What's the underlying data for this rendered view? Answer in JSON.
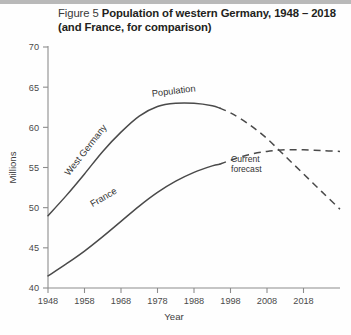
{
  "figure": {
    "number_label": "Figure 5",
    "title_line1": "Population of western Germany, 1948 – 2018",
    "title_line2": "(and France, for comparison)"
  },
  "chart_data": {
    "type": "line",
    "title": "Population of western Germany, 1948 – 2018 (and France, for comparison)",
    "xlabel": "Year",
    "ylabel": "Millions",
    "xlim": [
      1948,
      2028
    ],
    "ylim": [
      40,
      70
    ],
    "xticks": [
      1948,
      1958,
      1968,
      1978,
      1988,
      1998,
      2008,
      2018
    ],
    "yticks": [
      40,
      45,
      50,
      55,
      60,
      65,
      70
    ],
    "grid": false,
    "legend": "inline-labels",
    "series": [
      {
        "name": "West Germany",
        "label": "West Germany",
        "style_solid": "actual",
        "style_dashed": "forecast",
        "forecast_start_year": 1995,
        "x": [
          1948,
          1953,
          1958,
          1963,
          1968,
          1973,
          1978,
          1983,
          1988,
          1993,
          1995,
          1998,
          2003,
          2008,
          2013,
          2018,
          2023,
          2028
        ],
        "y": [
          49.0,
          51.5,
          54.2,
          57.0,
          59.4,
          61.4,
          62.6,
          63.0,
          63.0,
          62.7,
          62.4,
          61.8,
          60.4,
          58.6,
          56.4,
          54.2,
          52.0,
          49.8
        ]
      },
      {
        "name": "France",
        "label": "France",
        "style_solid": "actual",
        "style_dashed": "forecast",
        "forecast_start_year": 1995,
        "x": [
          1948,
          1953,
          1958,
          1963,
          1968,
          1973,
          1978,
          1983,
          1988,
          1993,
          1995,
          1998,
          2003,
          2008,
          2013,
          2018,
          2023,
          2028
        ],
        "y": [
          41.5,
          43.0,
          44.6,
          46.4,
          48.3,
          50.2,
          51.9,
          53.3,
          54.4,
          55.2,
          55.4,
          55.9,
          56.6,
          57.0,
          57.2,
          57.2,
          57.1,
          57.0
        ]
      }
    ],
    "annotations": [
      {
        "name": "population-label",
        "text": "Population",
        "x": 1982,
        "y": 64.2
      },
      {
        "name": "current-forecast-label",
        "text_line1": "Current",
        "text_line2": "forecast",
        "x": 2005,
        "y": 55.6
      }
    ]
  },
  "axis": {
    "y_title": "Millions",
    "x_title": "Year"
  },
  "labels": {
    "west_germany": "West Germany",
    "france": "France",
    "population": "Population",
    "current_forecast_l1": "Current",
    "current_forecast_l2": "forecast"
  }
}
